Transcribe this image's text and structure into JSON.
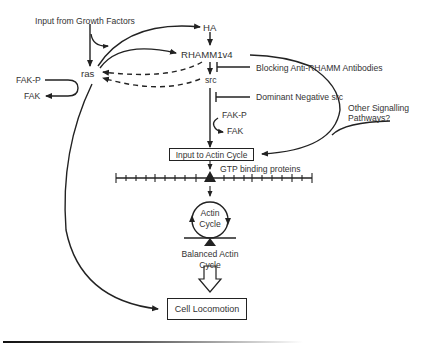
{
  "diagram": {
    "nodes": {
      "growth_factors": "Input from Growth Factors",
      "ha": "HA",
      "rhamm": "RHAMM1v4",
      "ras": "ras",
      "src": "src",
      "fak_p_left": "FAK-P",
      "fak_left": "FAK",
      "fak_p_right": "FAK-P",
      "fak_right": "FAK",
      "blocking": "Blocking Anti-RHAMM Antibodies",
      "dominant_negative": "Dominant Negative src",
      "other_pathways_1": "Other Signalling",
      "other_pathways_2": "Pathways?",
      "input_actin": "Input to Actin Cycle",
      "gtp": "GTP binding proteins",
      "actin_cycle_1": "Actin",
      "actin_cycle_2": "Cycle",
      "balanced_1": "Balanced Actin",
      "balanced_2": "Cycle",
      "cell_locomotion": "Cell Locomotion"
    },
    "edges": [
      {
        "from": "growth_factors",
        "to": "ras",
        "type": "activation"
      },
      {
        "from": "ras",
        "to": "ha",
        "type": "activation"
      },
      {
        "from": "ras",
        "to": "rhamm",
        "type": "activation"
      },
      {
        "from": "ha",
        "to": "rhamm",
        "type": "activation"
      },
      {
        "from": "rhamm",
        "to": "src",
        "type": "activation"
      },
      {
        "from": "rhamm",
        "to": "ras",
        "type": "dashed"
      },
      {
        "from": "src",
        "to": "ras",
        "type": "dashed"
      },
      {
        "from": "fak_p_left",
        "to": "fak_left",
        "type": "activation"
      },
      {
        "from": "blocking",
        "to": "rhamm_src_edge",
        "type": "inhibition"
      },
      {
        "from": "dominant_negative",
        "to": "src_edge",
        "type": "inhibition"
      },
      {
        "from": "src",
        "to": "input_actin",
        "type": "activation"
      },
      {
        "from": "fak_p_right",
        "to": "fak_right",
        "type": "activation"
      },
      {
        "from": "rhamm",
        "to": "input_actin",
        "type": "activation"
      },
      {
        "from": "other_pathways",
        "to": "input_actin",
        "type": "activation"
      },
      {
        "from": "input_actin",
        "to": "gtp",
        "type": "activation"
      },
      {
        "from": "gtp",
        "to": "actin_cycle",
        "type": "activation"
      },
      {
        "from": "balanced",
        "to": "cell_locomotion",
        "type": "hollow-arrow"
      },
      {
        "from": "ras",
        "to": "cell_locomotion",
        "type": "activation"
      }
    ],
    "ruler_ticks": 20,
    "colors": {
      "line": "#222222",
      "text": "#333333",
      "background": "#ffffff"
    }
  }
}
